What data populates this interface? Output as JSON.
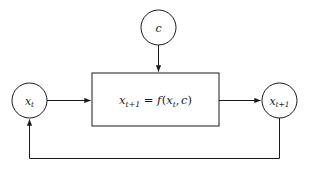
{
  "diagram": {
    "type": "block-diagram",
    "background_color": "#ffffff",
    "stroke_color": "#1a1a1a",
    "stroke_width": 1,
    "nodes": [
      {
        "id": "state-current",
        "shape": "circle",
        "label": "x_t",
        "label_parts": {
          "base": "x",
          "sub": "t"
        },
        "cx": 29.5,
        "cy": 100.5,
        "r": 17.5
      },
      {
        "id": "control-input",
        "shape": "circle",
        "label": "c",
        "label_parts": {
          "base": "c",
          "sub": ""
        },
        "cx": 158.5,
        "cy": 27.5,
        "r": 17.5
      },
      {
        "id": "state-next",
        "shape": "circle",
        "label": "x_{t+1}",
        "label_parts": {
          "base": "x",
          "sub": "t+1"
        },
        "cx": 279.5,
        "cy": 100.5,
        "r": 17.5
      },
      {
        "id": "transition-function",
        "shape": "rect",
        "label": "x_{t+1} = f(x_t, c)",
        "x": 92,
        "y": 73,
        "width": 127,
        "height": 53
      }
    ],
    "edges": [
      {
        "id": "edge-state-to-block",
        "from": "state-current",
        "to": "transition-function",
        "arrow": true,
        "label": ""
      },
      {
        "id": "edge-control-to-block",
        "from": "control-input",
        "to": "transition-function",
        "arrow": true,
        "label": ""
      },
      {
        "id": "edge-block-to-next",
        "from": "transition-function",
        "to": "state-next",
        "arrow": true,
        "label": ""
      },
      {
        "id": "edge-feedback",
        "from": "state-next",
        "to": "state-current",
        "arrow": true,
        "label": ""
      }
    ],
    "equation": {
      "lhs_base": "x",
      "lhs_sub": "t+1",
      "operator": "=",
      "fn": "f",
      "open_paren": "(",
      "arg1_base": "x",
      "arg1_sub": "t",
      "comma": ",",
      "arg2": "c",
      "close_paren": ")"
    }
  }
}
